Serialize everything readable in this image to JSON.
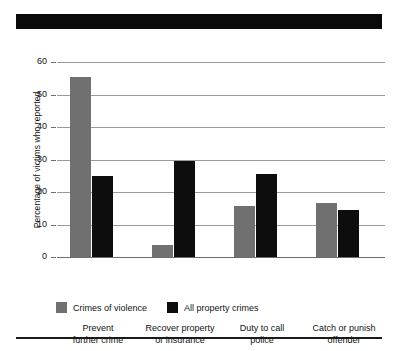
{
  "title_bar": {
    "name": "redacted-title-bar",
    "text": "",
    "color": "#0a0a0a"
  },
  "chart_data": {
    "type": "bar",
    "title": "",
    "xlabel": "",
    "ylabel": "Percentage of victims who reported",
    "ylim": [
      0,
      60
    ],
    "yticks": [
      0,
      10,
      20,
      30,
      40,
      50,
      60
    ],
    "ytick_labels": [
      "0",
      "10",
      "20",
      "30",
      "40",
      "50",
      "60"
    ],
    "grid": true,
    "legend_position": "bottom-left",
    "categories": [
      "Prevent further crime",
      "Recover property or insurance",
      "Duty to call police",
      "Catch or punish offender"
    ],
    "category_lines": [
      [
        "Prevent",
        "further crime"
      ],
      [
        "Recover property",
        "or insurance"
      ],
      [
        "Duty to call",
        "police"
      ],
      [
        "Catch or punish",
        "offender"
      ]
    ],
    "series": [
      {
        "name": "Crimes of violence",
        "color": "#707070",
        "values": [
          55.3,
          3.6,
          15.7,
          16.6
        ]
      },
      {
        "name": "All property crimes",
        "color": "#0d0d0d",
        "values": [
          24.9,
          29.6,
          25.5,
          14.5
        ]
      }
    ]
  }
}
